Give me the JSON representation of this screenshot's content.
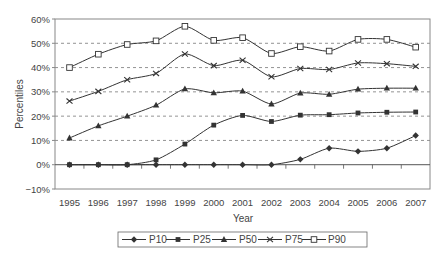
{
  "chart_data": {
    "type": "line",
    "title": "",
    "xlabel": "Year",
    "ylabel": "Percentiles",
    "ylim": [
      -10,
      60
    ],
    "yticks": [
      -10,
      0,
      10,
      20,
      30,
      40,
      50,
      60
    ],
    "ytick_labels": [
      "−10%",
      "0%",
      "10%",
      "20%",
      "30%",
      "40%",
      "50%",
      "60%"
    ],
    "grid": "horizontal dashed at 10%-50%",
    "legend_position": "bottom",
    "categories": [
      "1995",
      "1996",
      "1997",
      "1998",
      "1999",
      "2000",
      "2001",
      "2002",
      "2003",
      "2004",
      "2005",
      "2006",
      "2007"
    ],
    "series": [
      {
        "name": "P10",
        "marker": "diamond",
        "values": [
          0,
          0,
          0,
          0,
          0,
          0,
          0,
          0,
          2.2,
          6.8,
          5.5,
          6.8,
          12.0
        ]
      },
      {
        "name": "P25",
        "marker": "square-filled",
        "values": [
          0,
          0,
          0,
          2.0,
          8.5,
          16.3,
          20.3,
          17.8,
          20.4,
          20.6,
          21.3,
          21.6,
          21.7
        ]
      },
      {
        "name": "P50",
        "marker": "triangle",
        "values": [
          11.0,
          16.0,
          20.0,
          24.5,
          31.2,
          29.6,
          30.3,
          25.0,
          29.5,
          29.0,
          31.1,
          31.5,
          31.5
        ]
      },
      {
        "name": "P75",
        "marker": "x",
        "values": [
          26.2,
          30.2,
          35.0,
          37.6,
          45.6,
          40.8,
          43.0,
          36.2,
          39.6,
          39.2,
          41.9,
          41.6,
          40.5
        ]
      },
      {
        "name": "P90",
        "marker": "square-open",
        "values": [
          40.0,
          45.5,
          49.5,
          51.0,
          57.0,
          51.2,
          52.3,
          45.8,
          48.6,
          46.8,
          51.6,
          51.6,
          48.4
        ]
      }
    ]
  },
  "colors": {
    "line": "#333333",
    "grid": "#777777",
    "axis": "#888888",
    "text": "#444444"
  }
}
